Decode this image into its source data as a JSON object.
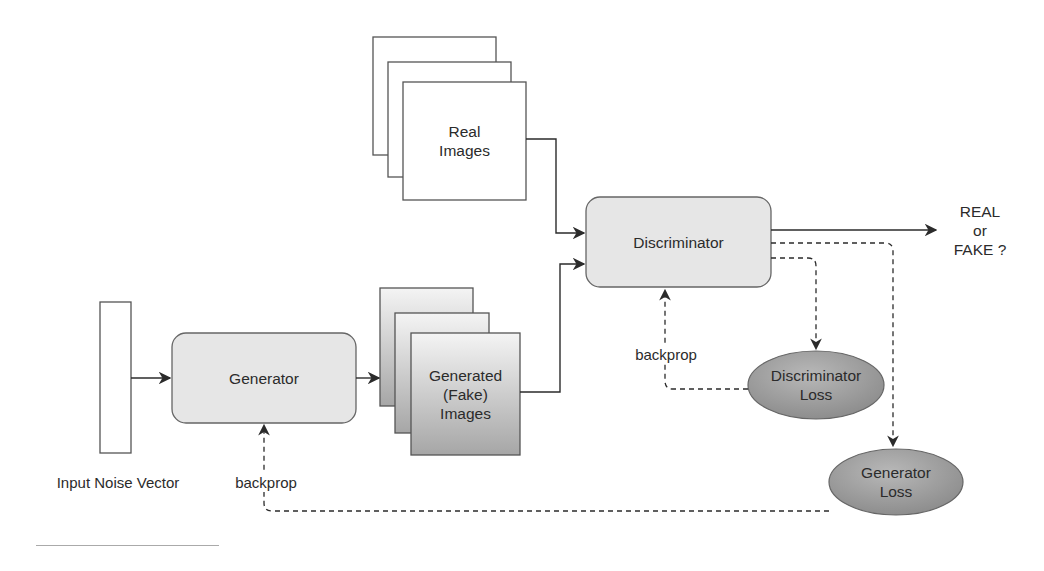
{
  "diagram": {
    "type": "GAN architecture flow diagram",
    "nodes": {
      "noise_vector": {
        "label": "Input Noise Vector"
      },
      "generator": {
        "label": "Generator"
      },
      "generated_images": {
        "line1": "Generated",
        "line2": "(Fake)",
        "line3": "Images"
      },
      "real_images": {
        "line1": "Real",
        "line2": "Images"
      },
      "discriminator": {
        "label": "Discriminator"
      },
      "output": {
        "line1": "REAL",
        "line2": "or",
        "line3": "FAKE ?"
      },
      "discriminator_loss": {
        "line1": "Discriminator",
        "line2": "Loss"
      },
      "generator_loss": {
        "line1": "Generator",
        "line2": "Loss"
      }
    },
    "edge_labels": {
      "disc_backprop": "backprop",
      "gen_backprop": "backprop"
    },
    "edges": [
      {
        "from": "Input Noise Vector",
        "to": "Generator",
        "style": "solid"
      },
      {
        "from": "Generator",
        "to": "Generated (Fake) Images",
        "style": "solid"
      },
      {
        "from": "Real Images",
        "to": "Discriminator",
        "style": "solid"
      },
      {
        "from": "Generated (Fake) Images",
        "to": "Discriminator",
        "style": "solid"
      },
      {
        "from": "Discriminator",
        "to": "REAL or FAKE ?",
        "style": "solid"
      },
      {
        "from": "Discriminator",
        "to": "Discriminator Loss",
        "style": "dashed"
      },
      {
        "from": "Discriminator",
        "to": "Generator Loss",
        "style": "dashed"
      },
      {
        "from": "Discriminator Loss",
        "to": "Discriminator",
        "style": "dashed",
        "label": "backprop"
      },
      {
        "from": "Generator Loss",
        "to": "Generator",
        "style": "dashed",
        "label": "backprop"
      }
    ],
    "colors": {
      "box_fill": "#e6e6e6",
      "stroke": "#555555",
      "ellipse_fill": "#9a9a9a",
      "fake_gradient_top": "#f2f2f2",
      "fake_gradient_bottom": "#a8a8a8",
      "line": "#2b2b2b"
    }
  }
}
